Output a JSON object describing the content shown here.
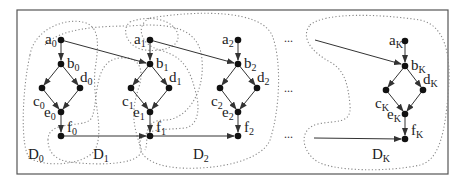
{
  "diagram": {
    "type": "dag-sequence-with-regions",
    "frame": {
      "x": 17,
      "y": 10,
      "w": 431,
      "h": 164,
      "color": "#555555"
    },
    "columns": [
      {
        "id": "0",
        "nodes": {
          "a": {
            "label": "a",
            "sub": "0",
            "x": 61,
            "y": 40
          },
          "b": {
            "label": "b",
            "sub": "0",
            "x": 61,
            "y": 64
          },
          "c": {
            "label": "c",
            "sub": "0",
            "x": 42,
            "y": 88
          },
          "d": {
            "label": "d",
            "sub": "0",
            "x": 80,
            "y": 88
          },
          "e": {
            "label": "e",
            "sub": "0",
            "x": 61,
            "y": 112
          },
          "f": {
            "label": "f",
            "sub": "0",
            "x": 61,
            "y": 136
          }
        }
      },
      {
        "id": "1",
        "nodes": {
          "a": {
            "label": "a",
            "sub": "1",
            "x": 150,
            "y": 40
          },
          "b": {
            "label": "b",
            "sub": "1",
            "x": 150,
            "y": 64
          },
          "c": {
            "label": "c",
            "sub": "1",
            "x": 131,
            "y": 88
          },
          "d": {
            "label": "d",
            "sub": "1",
            "x": 169,
            "y": 88
          },
          "e": {
            "label": "e",
            "sub": "1",
            "x": 150,
            "y": 112
          },
          "f": {
            "label": "f",
            "sub": "1",
            "x": 150,
            "y": 136
          }
        }
      },
      {
        "id": "2",
        "nodes": {
          "a": {
            "label": "a",
            "sub": "2",
            "x": 238,
            "y": 40
          },
          "b": {
            "label": "b",
            "sub": "2",
            "x": 238,
            "y": 64
          },
          "c": {
            "label": "c",
            "sub": "2",
            "x": 220,
            "y": 88
          },
          "d": {
            "label": "d",
            "sub": "2",
            "x": 257,
            "y": 88
          },
          "e": {
            "label": "e",
            "sub": "2",
            "x": 238,
            "y": 112
          },
          "f": {
            "label": "f",
            "sub": "2",
            "x": 238,
            "y": 136
          }
        }
      },
      {
        "id": "K",
        "nodes": {
          "a": {
            "label": "a",
            "sub": "K",
            "x": 405,
            "y": 41
          },
          "b": {
            "label": "b",
            "sub": "K",
            "x": 405,
            "y": 66
          },
          "c": {
            "label": "c",
            "sub": "K",
            "x": 386,
            "y": 90
          },
          "d": {
            "label": "d",
            "sub": "K",
            "x": 423,
            "y": 90
          },
          "e": {
            "label": "e",
            "sub": "K",
            "x": 405,
            "y": 114
          },
          "f": {
            "label": "f",
            "sub": "K",
            "x": 405,
            "y": 139
          }
        }
      }
    ],
    "regions": [
      {
        "label": "D",
        "sub": "0",
        "x": 28,
        "y": 159
      },
      {
        "label": "D",
        "sub": "1",
        "x": 93,
        "y": 159
      },
      {
        "label": "D",
        "sub": "2",
        "x": 193,
        "y": 159
      },
      {
        "label": "D",
        "sub": "K",
        "x": 372,
        "y": 159
      }
    ],
    "ellipsis": {
      "text": "...",
      "positions": [
        [
          284,
          42
        ],
        [
          284,
          92
        ],
        [
          284,
          138
        ]
      ]
    }
  }
}
